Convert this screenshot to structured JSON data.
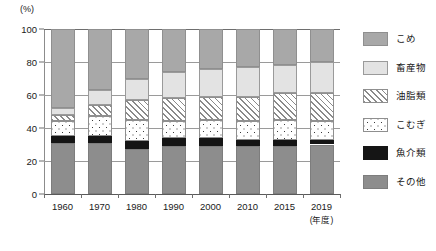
{
  "chart_data": {
    "type": "bar",
    "stacked": true,
    "stack_mode": "percent",
    "title": "",
    "subtitle": "",
    "xlabel": "(年度)",
    "ylabel": "(%)",
    "unit_label": "(%)",
    "ylim": [
      0,
      100
    ],
    "yticks": [
      0,
      20,
      40,
      60,
      80,
      100
    ],
    "ytick_labels": [
      "0",
      "20",
      "40",
      "60",
      "80",
      "100"
    ],
    "grid": true,
    "grid_axis": "y",
    "legend_position": "right",
    "categories": [
      "1960",
      "1970",
      "1980",
      "1990",
      "2000",
      "2010",
      "2015",
      "2019"
    ],
    "series": [
      {
        "name": "その他",
        "pattern": "solid-gray-mid",
        "color": "#8d8d8d",
        "values": [
          31,
          31,
          27,
          29,
          29,
          29,
          29,
          30
        ]
      },
      {
        "name": "魚介類",
        "pattern": "solid-black",
        "color": "#151515",
        "values": [
          4,
          4,
          5,
          5,
          5,
          4,
          4,
          3
        ]
      },
      {
        "name": "こむぎ",
        "pattern": "dotted",
        "color": "#ffffff",
        "values": [
          9,
          12,
          13,
          10,
          11,
          11,
          12,
          11
        ]
      },
      {
        "name": "油脂類",
        "pattern": "diagonal-hatch",
        "color": "#ffffff",
        "values": [
          4,
          7,
          12,
          14,
          14,
          15,
          16,
          17
        ]
      },
      {
        "name": "畜産物",
        "pattern": "solid-light",
        "color": "#e3e3e3",
        "values": [
          4,
          9,
          13,
          16,
          17,
          18,
          17,
          19
        ]
      },
      {
        "name": "こめ",
        "pattern": "solid-gray",
        "color": "#a8a8a8",
        "values": [
          48,
          37,
          30,
          26,
          24,
          23,
          22,
          20
        ]
      }
    ],
    "cumulative_tops": {
      "note": "top boundary of each stack level, bottom-to-top, in percent",
      "1960": [
        31,
        35,
        44,
        48,
        52,
        100
      ],
      "1970": [
        31,
        35,
        47,
        54,
        63,
        100
      ],
      "1980": [
        27,
        32,
        45,
        57,
        70,
        100
      ],
      "1990": [
        29,
        34,
        44,
        58,
        74,
        100
      ],
      "2000": [
        29,
        34,
        45,
        59,
        76,
        100
      ],
      "2010": [
        29,
        33,
        44,
        59,
        77,
        100
      ],
      "2015": [
        29,
        33,
        45,
        61,
        78,
        100
      ],
      "2019": [
        30,
        33,
        44,
        61,
        80,
        100
      ]
    }
  },
  "legend": {
    "items": [
      {
        "label": "こめ",
        "swatch": "solid-gray",
        "color": "#a8a8a8"
      },
      {
        "label": "畜産物",
        "swatch": "solid-light",
        "color": "#e3e3e3"
      },
      {
        "label": "油脂類",
        "swatch": "diagonal-hatch",
        "color": "#ffffff"
      },
      {
        "label": "こむぎ",
        "swatch": "dotted",
        "color": "#ffffff"
      },
      {
        "label": "魚介類",
        "swatch": "solid-black",
        "color": "#151515"
      },
      {
        "label": "その他",
        "swatch": "solid-gray-mid",
        "color": "#8d8d8d"
      }
    ]
  }
}
